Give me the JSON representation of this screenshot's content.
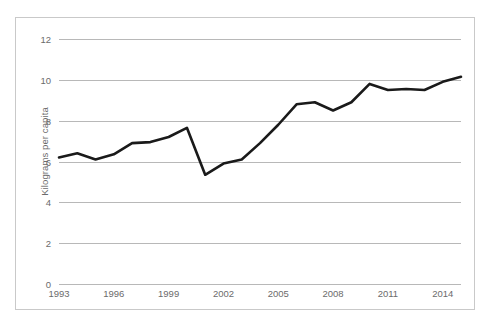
{
  "chart_data": {
    "type": "line",
    "title": "",
    "xlabel": "",
    "ylabel": "Kilograms per capita",
    "ylim": [
      0,
      12
    ],
    "xlim": [
      1993,
      2015
    ],
    "grid": true,
    "legend": false,
    "y_ticks": [
      12,
      10,
      8,
      6,
      4,
      2,
      0
    ],
    "x_ticks": [
      1993,
      1996,
      1999,
      2002,
      2005,
      2008,
      2011,
      2014
    ],
    "x": [
      1993,
      1994,
      1995,
      1996,
      1997,
      1998,
      1999,
      2000,
      2001,
      2002,
      2003,
      2004,
      2005,
      2006,
      2007,
      2008,
      2009,
      2010,
      2011,
      2012,
      2013,
      2014,
      2015
    ],
    "values": [
      6.2,
      6.4,
      6.1,
      6.35,
      6.9,
      6.95,
      7.2,
      7.65,
      5.35,
      5.9,
      6.1,
      6.9,
      7.8,
      8.8,
      8.9,
      8.5,
      8.9,
      9.8,
      9.5,
      9.55,
      9.5,
      9.9,
      10.15
    ],
    "series": [
      {
        "name": "Kilograms per capita",
        "color": "#1a1a1a",
        "line_width": 2.6,
        "markers": false
      }
    ],
    "style": {
      "gridline_color": "#b8b8b8",
      "tick_label_color": "#6b6b6b",
      "axis_title_color": "#6b6b6b",
      "frame_color": "#c9c9c9",
      "background": "#ffffff"
    }
  }
}
